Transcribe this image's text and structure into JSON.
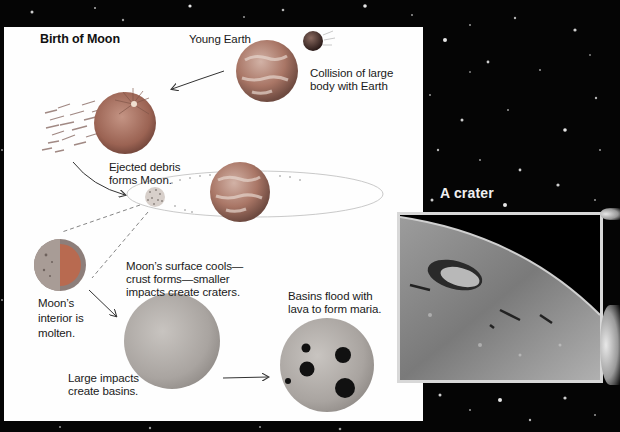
{
  "diagram": {
    "title": "Birth of Moon",
    "labels": {
      "young_earth": "Young Earth",
      "collision_line1": "Collision of large",
      "collision_line2": "body with Earth",
      "ejected_line1": "Ejected debris",
      "ejected_line2": "forms Moon.",
      "cools_line1": "Moon’s surface cools—",
      "cools_line2": "crust forms—smaller",
      "cools_line3": "impacts create craters.",
      "molten_line1": "Moon’s",
      "molten_line2": "interior is",
      "molten_line3": "molten.",
      "basins_line1": "Large impacts",
      "basins_line2": "create basins.",
      "maria_line1": "Basins flood with",
      "maria_line2": "lava to form maria."
    },
    "icons": [
      "young-earth-globe",
      "impactor-body",
      "collision-earth",
      "debris-cloud",
      "earth-orbit-globe",
      "moon-cross-section",
      "cratered-moon",
      "maria-moon",
      "arrow"
    ]
  },
  "photo": {
    "heading": "A crater"
  },
  "colors": {
    "panel": "#fefefe",
    "background": "#050505",
    "earth_tone": "#b07a68",
    "moon_tone": "#a8a8a8",
    "maria": "#111111",
    "heading": "#f0f0f0"
  }
}
